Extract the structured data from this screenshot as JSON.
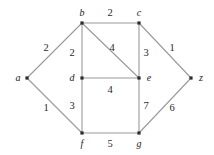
{
  "figure": {
    "name": "weighted-undirected-graph",
    "background_color": "#ffffff",
    "edge_color": "#9a9a9a",
    "node_color": "#2b2b2b",
    "label_color": "#232323"
  },
  "chart_data": {
    "type": "diagram",
    "title": "",
    "nodes": [
      {
        "id": "a",
        "label": "a",
        "x": 27,
        "y": 78,
        "label_x": 18,
        "label_y": 78
      },
      {
        "id": "b",
        "label": "b",
        "x": 82,
        "y": 23,
        "label_x": 82,
        "label_y": 13
      },
      {
        "id": "c",
        "label": "c",
        "x": 139,
        "y": 23,
        "label_x": 139,
        "label_y": 13
      },
      {
        "id": "d",
        "label": "d",
        "x": 82,
        "y": 78,
        "label_x": 72,
        "label_y": 78
      },
      {
        "id": "e",
        "label": "e",
        "x": 139,
        "y": 78,
        "label_x": 149,
        "label_y": 78
      },
      {
        "id": "f",
        "label": "f",
        "x": 82,
        "y": 133,
        "label_x": 82,
        "label_y": 144
      },
      {
        "id": "g",
        "label": "g",
        "x": 139,
        "y": 133,
        "label_x": 139,
        "label_y": 144
      },
      {
        "id": "z",
        "label": "z",
        "x": 191,
        "y": 78,
        "label_x": 201,
        "label_y": 78
      }
    ],
    "edges": [
      {
        "from": "a",
        "to": "b",
        "weight": "2",
        "label_x": 46,
        "label_y": 48
      },
      {
        "from": "a",
        "to": "f",
        "weight": "1",
        "label_x": 46,
        "label_y": 108
      },
      {
        "from": "b",
        "to": "c",
        "weight": "2",
        "label_x": 110,
        "label_y": 13
      },
      {
        "from": "b",
        "to": "d",
        "weight": "2",
        "label_x": 72,
        "label_y": 53
      },
      {
        "from": "b",
        "to": "e",
        "weight": "4",
        "label_x": 112,
        "label_y": 48
      },
      {
        "from": "c",
        "to": "e",
        "weight": "3",
        "label_x": 146,
        "label_y": 53
      },
      {
        "from": "c",
        "to": "z",
        "weight": "1",
        "label_x": 172,
        "label_y": 48
      },
      {
        "from": "d",
        "to": "e",
        "weight": "4",
        "label_x": 110,
        "label_y": 90
      },
      {
        "from": "d",
        "to": "f",
        "weight": "3",
        "label_x": 72,
        "label_y": 106
      },
      {
        "from": "e",
        "to": "g",
        "weight": "7",
        "label_x": 146,
        "label_y": 106
      },
      {
        "from": "f",
        "to": "g",
        "weight": "5",
        "label_x": 110,
        "label_y": 144
      },
      {
        "from": "g",
        "to": "z",
        "weight": "6",
        "label_x": 172,
        "label_y": 108
      }
    ]
  }
}
